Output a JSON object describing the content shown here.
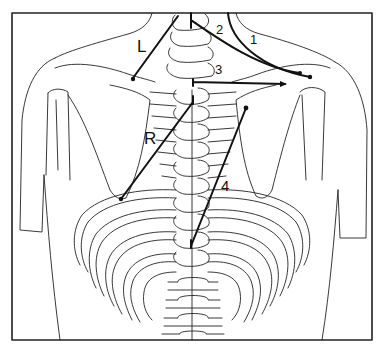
{
  "figure": {
    "type": "anatomical line drawing",
    "line_color": "#111111",
    "background": "#ffffff"
  },
  "labels": {
    "L": "L",
    "R": "R",
    "n1": "1",
    "n2": "2",
    "n3": "3",
    "n4": "4"
  },
  "lines": [
    {
      "id": "L",
      "from": [
        188,
        15
      ],
      "to": [
        133,
        78
      ]
    },
    {
      "id": "1",
      "from": [
        230,
        12
      ],
      "to": [
        302,
        77
      ],
      "curved": true
    },
    {
      "id": "2",
      "from": [
        190,
        12
      ],
      "to": [
        302,
        76
      ],
      "curved": true
    },
    {
      "id": "3",
      "from": [
        195,
        81
      ],
      "to": [
        285,
        84
      ]
    },
    {
      "id": "R",
      "from": [
        193,
        97
      ],
      "to": [
        121,
        199
      ]
    },
    {
      "id": "4",
      "from": [
        246,
        108
      ],
      "to": [
        191,
        244
      ]
    }
  ]
}
